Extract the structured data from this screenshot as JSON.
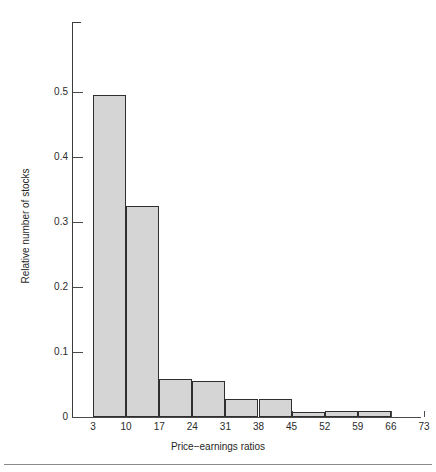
{
  "figure": {
    "background_color": "#ffffff",
    "axis_color": "#3c3c3c",
    "bar_fill_color": "#d5d5d5",
    "bar_edge_color": "#2f2f2f",
    "footer_rule_color": "#8a8a8a"
  },
  "chart_data": {
    "type": "bar",
    "title": "",
    "subtitle": "",
    "xlabel": "Price−earnings ratios",
    "ylabel": "Relative number of stocks",
    "grid": false,
    "legend": false,
    "legend_position": "none",
    "histogram": true,
    "bin_width": 7,
    "bin_edges": [
      3,
      10,
      17,
      24,
      31,
      38,
      45,
      52,
      59,
      66,
      73
    ],
    "categories": [
      "3–10",
      "10–17",
      "17–24",
      "24–31",
      "31–38",
      "38–45",
      "45–52",
      "52–59",
      "59–66",
      "66–73"
    ],
    "values": [
      0.495,
      0.325,
      0.059,
      0.056,
      0.027,
      0.027,
      0.008,
      0.01,
      0.01,
      0.0
    ],
    "xlim": [
      3,
      73
    ],
    "ylim": [
      0,
      0.55
    ],
    "xticks": [
      3,
      10,
      17,
      24,
      31,
      38,
      45,
      52,
      59,
      66,
      73
    ],
    "xtick_labels": [
      "3",
      "10",
      "17",
      "24",
      "31",
      "38",
      "45",
      "52",
      "59",
      "66",
      "73"
    ],
    "yticks": [
      0,
      0.1,
      0.2,
      0.3,
      0.4,
      0.5
    ],
    "ytick_labels": [
      "0",
      "0.1",
      "0.2",
      "0.3",
      "0.4",
      "0.5"
    ]
  }
}
